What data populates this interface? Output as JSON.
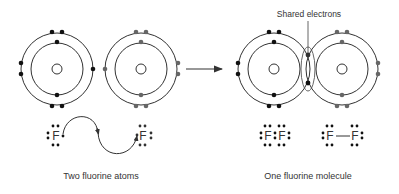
{
  "labels": {
    "shared_electrons": "Shared electrons",
    "left_caption": "Two fluorine atoms",
    "right_caption": "One fluorine molecule",
    "element_symbol": "F",
    "bond": "—"
  },
  "colors": {
    "stroke": "#333333",
    "electron_dark": "#111111",
    "electron_gray": "#666666",
    "background": "#ffffff"
  },
  "atoms": [
    {
      "id": "atom-left",
      "cx": 57,
      "cy": 69,
      "electron_color": "dark"
    },
    {
      "id": "atom-right",
      "cx": 141,
      "cy": 69,
      "electron_color": "gray"
    },
    {
      "id": "molecule-left",
      "cx": 274,
      "cy": 69,
      "electron_color": "dark"
    },
    {
      "id": "molecule-right",
      "cx": 342,
      "cy": 69,
      "electron_color": "gray"
    }
  ]
}
